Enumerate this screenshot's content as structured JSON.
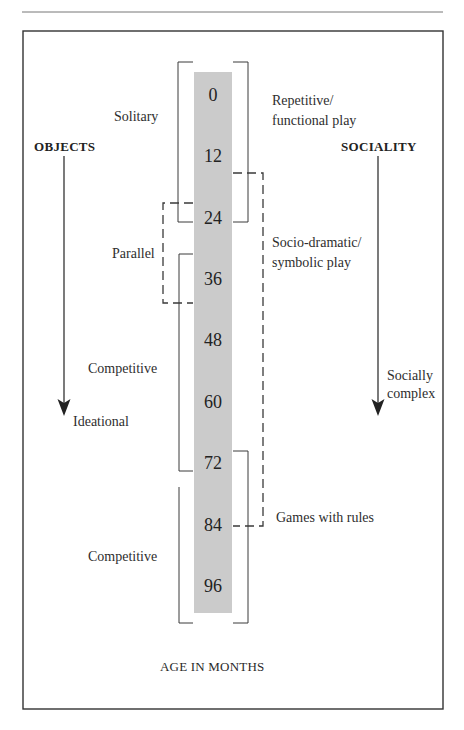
{
  "diagram": {
    "x_axis_label": "AGE IN MONTHS",
    "ages": [
      "0",
      "12",
      "24",
      "36",
      "48",
      "60",
      "72",
      "84",
      "96"
    ],
    "left_axis": {
      "title": "OBJECTS",
      "end_label": "Ideational"
    },
    "right_axis": {
      "title": "SOCIALITY",
      "end_label_lines": [
        "Socially",
        "complex"
      ]
    },
    "left_stages": [
      {
        "label": "Solitary",
        "bracket": "solid",
        "span_months": [
          0,
          24
        ]
      },
      {
        "label": "Parallel",
        "bracket": "dashed",
        "span_months": [
          24,
          36
        ]
      },
      {
        "label": "Competitive",
        "bracket": "solid",
        "span_months": [
          36,
          72
        ]
      },
      {
        "label": "Competitive",
        "bracket": "solid",
        "span_months": [
          72,
          96
        ]
      }
    ],
    "right_stages": [
      {
        "lines": [
          "Repetitive/",
          "functional play"
        ],
        "bracket": "solid",
        "span_months": [
          0,
          24
        ]
      },
      {
        "lines": [
          "Socio-dramatic/",
          "symbolic play"
        ],
        "bracket": "dashed",
        "span_months": [
          12,
          84
        ]
      },
      {
        "lines": [
          "Games with rules"
        ],
        "bracket": "solid",
        "span_months": [
          72,
          96
        ]
      }
    ],
    "colors": {
      "age_bar": "#cbcbcb",
      "lines": "#3a3a3a",
      "text": "#2a2a2a"
    }
  }
}
